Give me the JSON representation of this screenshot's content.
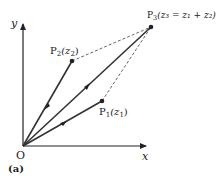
{
  "diagram": {
    "panel_label": "(a)",
    "origin_label": "O",
    "x_axis_label": "x",
    "y_axis_label": "y",
    "points": {
      "P1": {
        "label_main": "P",
        "label_sub": "1",
        "label_arg": "(z",
        "label_arg_sub": "1",
        "label_close": ")"
      },
      "P2": {
        "label_main": "P",
        "label_sub": "2",
        "label_arg": "(z",
        "label_arg_sub": "2",
        "label_close": ")"
      },
      "P3": {
        "label_main": "P",
        "label_sub": "3",
        "label_text": "(z₃ = z₁ + z₂)"
      }
    },
    "colors": {
      "line": "#333333",
      "dashed": "#555555",
      "point": "#222222"
    }
  }
}
